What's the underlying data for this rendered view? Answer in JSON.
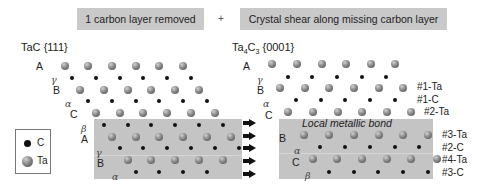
{
  "header": {
    "step1": "1 carbon layer removed",
    "plus": "+",
    "step2": "Crystal shear along missing carbon layer"
  },
  "left_panel": {
    "title_main": "TaC",
    "title_plane": "{111}",
    "stacking_labels": [
      "A",
      "γ",
      "B",
      "α",
      "C",
      "β",
      "A",
      "γ",
      "B",
      "α"
    ]
  },
  "right_panel": {
    "title_prefix": "Ta",
    "title_sub1": "4",
    "title_mid": "C",
    "title_sub2": "3",
    "title_plane": "{0001}",
    "stacking_labels": [
      "A",
      "γ",
      "B",
      "α",
      "C",
      "B",
      "α",
      "C",
      "β"
    ],
    "bond_note": "Local metallic bond",
    "layer_tags": [
      "#1-Ta",
      "#1-C",
      "#2-Ta",
      "#3-Ta",
      "#2-C",
      "#4-Ta",
      "#3-C"
    ]
  },
  "legend": {
    "items": [
      {
        "symbol": "C",
        "label": "C"
      },
      {
        "symbol": "Ta",
        "label": "Ta"
      }
    ]
  },
  "colors": {
    "banner_bg": "#c9c9c9",
    "shaded_region": "#c4c4c4",
    "carbon_atom": "#111111",
    "tantalum_atom": "#7a7a7a"
  }
}
